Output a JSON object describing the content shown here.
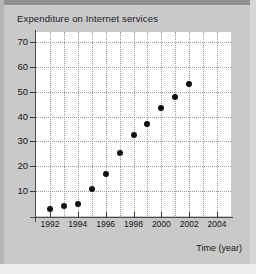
{
  "chart_data": {
    "type": "scatter",
    "title": "Expenditure on Internet services",
    "xlabel": "Time (year)",
    "ylabel": "",
    "xlim": [
      1991,
      2005
    ],
    "ylim": [
      0,
      74
    ],
    "grid": true,
    "legend": null,
    "x_ticks": [
      1992,
      1994,
      1996,
      1998,
      2000,
      2002,
      2004
    ],
    "x_tick_labels": [
      "1992",
      "1994",
      "1996",
      "1998",
      "2000",
      "2002",
      "2004"
    ],
    "x_minor_ticks": [
      1993,
      1995,
      1997,
      1999,
      2001,
      2003
    ],
    "y_ticks": [
      10,
      20,
      30,
      40,
      50,
      60,
      70
    ],
    "y_tick_labels": [
      "10",
      "20",
      "30",
      "40",
      "50",
      "60",
      "70"
    ],
    "x": [
      1992,
      1993,
      1994,
      1995,
      1996,
      1997,
      1998,
      1999,
      2000,
      2001,
      2002
    ],
    "values": [
      3,
      4,
      5,
      11,
      17,
      25.5,
      32.5,
      37,
      43.5,
      48,
      53
    ],
    "point_color": "#111111",
    "grid_color": "#9a9a9a",
    "axis_color": "#4a4a4a",
    "plot_background": "#ffffff",
    "figure_background": "#c9c9c9"
  }
}
